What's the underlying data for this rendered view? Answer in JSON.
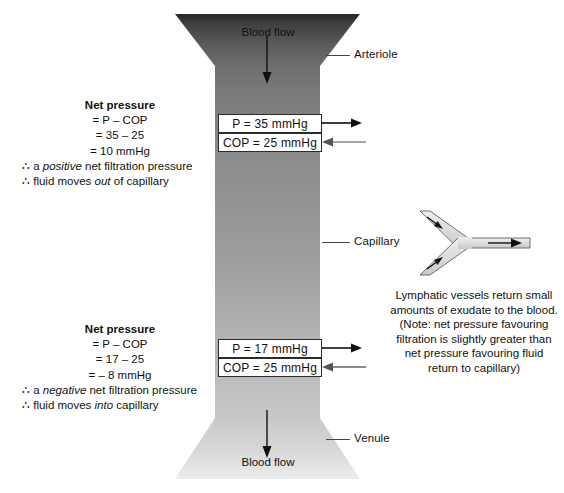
{
  "diagram": {
    "title_alt": "Capillary fluid exchange: net filtration pressure at arteriolar and venular ends",
    "colors": {
      "vessel_dark": "#4a4a4a",
      "vessel_mid": "#8c8c8c",
      "vessel_light": "#d2d2d2",
      "arteriole_top": "#2a2a2a",
      "line": "#2b2b2b",
      "lymph_fill": "#d9d9d9",
      "lymph_stroke": "#6e6e6e",
      "text": "#111111"
    }
  },
  "vessel": {
    "top_flow_label": "Blood flow",
    "bottom_flow_label": "Blood flow",
    "segments": [
      {
        "name": "arteriole",
        "label": "Arteriole"
      },
      {
        "name": "capillary",
        "label": "Capillary"
      },
      {
        "name": "venule",
        "label": "Venule"
      }
    ]
  },
  "pressure_boxes": [
    {
      "id": "arteriolar-end",
      "hydrostatic": "P = 35 mmHg",
      "oncotic": "COP = 25 mmHg",
      "hydrostatic_direction": "out",
      "oncotic_direction": "in"
    },
    {
      "id": "venular-end",
      "hydrostatic": "P = 17 mmHg",
      "oncotic": "COP = 25 mmHg",
      "hydrostatic_direction": "out",
      "oncotic_direction": "in"
    }
  ],
  "calculations": [
    {
      "id": "arteriolar-net-pressure",
      "title": "Net pressure",
      "line1": "= P – COP",
      "line2": "= 35 – 25",
      "line3": "= 10 mmHg",
      "conclusion1_pre": "∴ a ",
      "conclusion1_em": "positive",
      "conclusion1_post": " net filtration pressure",
      "conclusion2_pre": "∴ fluid moves ",
      "conclusion2_em": "out",
      "conclusion2_post": " of capillary"
    },
    {
      "id": "venular-net-pressure",
      "title": "Net pressure",
      "line1": "= P – COP",
      "line2": "= 17 – 25",
      "line3": "= – 8 mmHg",
      "conclusion1_pre": "∴ a ",
      "conclusion1_em": "negative",
      "conclusion1_post": " net filtration pressure",
      "conclusion2_pre": "∴ fluid moves ",
      "conclusion2_em": "into",
      "conclusion2_post": " capillary"
    }
  ],
  "lymphatic": {
    "graphic_name": "lymphatic-vessel-y-junction",
    "note_lines": [
      "Lymphatic vessels return small",
      "amounts of exudate to the blood.",
      "(Note: net pressure favouring",
      "filtration is slightly greater than",
      "net pressure favouring fluid",
      "return to capillary)"
    ]
  }
}
